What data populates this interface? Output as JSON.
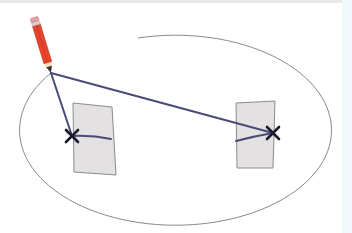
{
  "diagram": {
    "elements": {
      "ellipse": {
        "center": [
          172,
          133
        ],
        "rx": 156,
        "ry": 95,
        "stroke": "#8a8a8a"
      },
      "pencil": {
        "tip": [
          51,
          73
        ],
        "body_color": "#e8442c",
        "eraser_color": "#e8a0a8",
        "ferrule_color": "#d9d0c8"
      },
      "left_focus": {
        "position": [
          72,
          136
        ],
        "card_color": "#e4e1e3"
      },
      "right_focus": {
        "position": [
          273,
          133
        ],
        "card_color": "#e4e1e3"
      },
      "string_color": "#4a4a78",
      "pin_mark_color": "#1a1a2a"
    },
    "labels": {
      "pencil": "pencil-icon",
      "left_pin": "pin-x-icon",
      "right_pin": "pin-x-icon"
    },
    "colors": {
      "background": "#ffffff",
      "side_strip": "#f1f8fc",
      "top_strip": "#e9e6e8"
    }
  }
}
